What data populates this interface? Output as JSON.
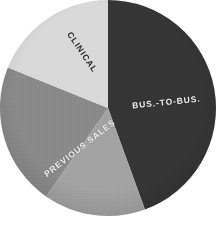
{
  "chart_data": {
    "type": "pie",
    "title": "",
    "subtitle": "",
    "xlabel": "",
    "ylabel": "",
    "legend_position": "none",
    "grid": false,
    "center": {
      "cx": 108,
      "cy": 108,
      "r": 108
    },
    "start_angle_deg": 0,
    "direction": "clockwise",
    "categories": [
      "BUS.-TO-BUS.",
      "Unlabeled",
      "PREVIOUS SALES",
      "CLINICAL"
    ],
    "values": [
      44.4,
      15.3,
      21.4,
      18.9
    ],
    "value_unit": "percent",
    "slices": [
      {
        "label": "BUS.-TO-BUS.",
        "value": 44.4,
        "start_deg": 0,
        "end_deg": 160,
        "color": "#363636",
        "label_color": "#f2f2f2",
        "label_rotation_deg": -6,
        "labelled": true
      },
      {
        "label": "",
        "value": 15.3,
        "start_deg": 160,
        "end_deg": 215,
        "color": "#a3a3a3",
        "label_color": "#ffffff",
        "label_rotation_deg": 0,
        "labelled": false
      },
      {
        "label": "PREVIOUS SALES",
        "value": 21.4,
        "start_deg": 215,
        "end_deg": 292,
        "color": "#8a8a8a",
        "label_color": "#f4f4f4",
        "label_rotation_deg": -38,
        "labelled": true
      },
      {
        "label": "CLINICAL",
        "value": 18.9,
        "start_deg": 292,
        "end_deg": 360,
        "color": "#d9d9d9",
        "label_color": "#2a2a2a",
        "label_rotation_deg": 56,
        "labelled": true
      }
    ],
    "colors": {
      "bus_to_bus": "#363636",
      "unlabeled": "#a3a3a3",
      "previous_sales": "#8a8a8a",
      "clinical": "#d9d9d9",
      "background": "#ffffff"
    }
  },
  "labels": {
    "bus_to_bus": "BUS.-TO-BUS.",
    "clinical": "CLINICAL",
    "previous_sales": "PREVIOUS SALES"
  }
}
